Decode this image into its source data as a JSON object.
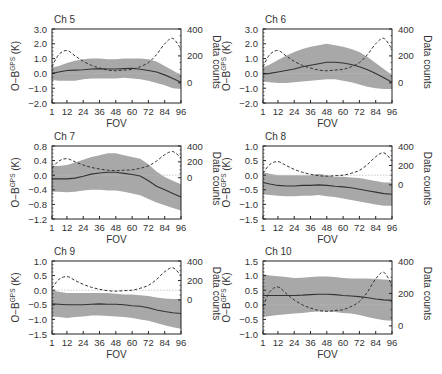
{
  "figure": {
    "xlabel": "FOV",
    "ylabel_left_prefix": "O−B",
    "ylabel_left_sup": "GPS",
    "ylabel_left_suffix": " (K)",
    "ylabel_right": "Data counts",
    "colors": {
      "band": "#a8a8a8",
      "mean": "#333333",
      "counts": "#333333",
      "zero": "#bbbbbb",
      "axis": "#222222"
    }
  },
  "chart_data": [
    {
      "type": "line",
      "title": "Ch 5",
      "x": [
        1,
        6,
        12,
        18,
        24,
        30,
        36,
        42,
        48,
        54,
        60,
        66,
        72,
        78,
        84,
        90,
        96
      ],
      "xticks": [
        1,
        12,
        24,
        36,
        48,
        60,
        72,
        84,
        96
      ],
      "ylim": [
        -2.0,
        3.0
      ],
      "yticks": [
        -2.0,
        -1.0,
        0.0,
        1.0,
        2.0,
        3.0
      ],
      "ytick_labels": [
        "−2.0",
        "−1.0",
        "0.0",
        "1.0",
        "2.0",
        "3.0"
      ],
      "y2lim": [
        -150,
        400
      ],
      "y2ticks": [
        0,
        200,
        400
      ],
      "series": [
        {
          "name": "mean O-B",
          "values": [
            0.0,
            0.1,
            0.2,
            0.22,
            0.25,
            0.3,
            0.32,
            0.3,
            0.3,
            0.32,
            0.35,
            0.28,
            0.2,
            0.1,
            -0.1,
            -0.35,
            -0.6
          ]
        },
        {
          "name": "std upper",
          "values": [
            0.4,
            0.5,
            0.7,
            0.85,
            0.95,
            1.0,
            1.0,
            0.95,
            0.95,
            1.0,
            1.0,
            1.0,
            0.95,
            0.8,
            0.5,
            0.2,
            -0.1
          ]
        },
        {
          "name": "std lower",
          "values": [
            -0.45,
            -0.5,
            -0.5,
            -0.5,
            -0.4,
            -0.35,
            -0.35,
            -0.35,
            -0.35,
            -0.3,
            -0.35,
            -0.4,
            -0.5,
            -0.65,
            -0.8,
            -1.0,
            -1.05
          ]
        },
        {
          "name": "data counts",
          "axis": "right",
          "values": [
            120,
            210,
            240,
            200,
            160,
            130,
            110,
            95,
            90,
            95,
            100,
            120,
            150,
            210,
            290,
            330,
            250
          ]
        }
      ]
    },
    {
      "type": "line",
      "title": "Ch 6",
      "x": [
        1,
        6,
        12,
        18,
        24,
        30,
        36,
        42,
        48,
        54,
        60,
        66,
        72,
        78,
        84,
        90,
        96
      ],
      "xticks": [
        1,
        12,
        24,
        36,
        48,
        60,
        72,
        84,
        96
      ],
      "ylim": [
        -2.0,
        3.0
      ],
      "yticks": [
        -2.0,
        -1.0,
        0.0,
        1.0,
        2.0,
        3.0
      ],
      "ytick_labels": [
        "−2.0",
        "−1.0",
        "0.0",
        "1.0",
        "2.0",
        "3.0"
      ],
      "y2lim": [
        -150,
        400
      ],
      "y2ticks": [
        0,
        200,
        400
      ],
      "series": [
        {
          "name": "mean O-B",
          "values": [
            -0.05,
            0.0,
            0.1,
            0.2,
            0.3,
            0.45,
            0.55,
            0.65,
            0.75,
            0.75,
            0.7,
            0.6,
            0.45,
            0.25,
            0.0,
            -0.3,
            -0.6
          ]
        },
        {
          "name": "std upper",
          "values": [
            0.4,
            0.6,
            0.9,
            1.2,
            1.45,
            1.65,
            1.8,
            1.9,
            2.0,
            1.9,
            1.8,
            1.65,
            1.45,
            1.1,
            0.7,
            0.3,
            -0.1
          ]
        },
        {
          "name": "std lower",
          "values": [
            -0.55,
            -0.6,
            -0.65,
            -0.65,
            -0.6,
            -0.55,
            -0.5,
            -0.45,
            -0.4,
            -0.4,
            -0.5,
            -0.6,
            -0.75,
            -0.9,
            -1.0,
            -1.05,
            -1.05
          ]
        },
        {
          "name": "data counts",
          "axis": "right",
          "values": [
            120,
            210,
            240,
            200,
            160,
            130,
            110,
            95,
            90,
            95,
            100,
            120,
            150,
            210,
            290,
            330,
            250
          ]
        }
      ]
    },
    {
      "type": "line",
      "title": "Ch 7",
      "x": [
        1,
        6,
        12,
        18,
        24,
        30,
        36,
        42,
        48,
        54,
        60,
        66,
        72,
        78,
        84,
        90,
        96
      ],
      "xticks": [
        1,
        12,
        24,
        36,
        48,
        60,
        72,
        84,
        96
      ],
      "ylim": [
        -1.2,
        0.8
      ],
      "yticks": [
        -1.2,
        -0.8,
        -0.4,
        0.0,
        0.4,
        0.8
      ],
      "ytick_labels": [
        "−1.2",
        "−0.8",
        "−0.4",
        "0.0",
        "0.4",
        "0.8"
      ],
      "y2lim": [
        -520,
        400
      ],
      "y2ticks": [
        0,
        200,
        400
      ],
      "series": [
        {
          "name": "mean O-B",
          "values": [
            -0.1,
            -0.1,
            -0.1,
            -0.08,
            -0.03,
            0.03,
            0.06,
            0.08,
            0.08,
            0.05,
            0.02,
            -0.02,
            -0.15,
            -0.3,
            -0.4,
            -0.5,
            -0.6
          ]
        },
        {
          "name": "std upper",
          "values": [
            0.25,
            0.25,
            0.28,
            0.35,
            0.42,
            0.5,
            0.55,
            0.6,
            0.6,
            0.55,
            0.5,
            0.45,
            0.3,
            0.1,
            -0.05,
            -0.15,
            -0.25
          ]
        },
        {
          "name": "std lower",
          "values": [
            -0.45,
            -0.45,
            -0.47,
            -0.45,
            -0.42,
            -0.4,
            -0.4,
            -0.42,
            -0.42,
            -0.45,
            -0.5,
            -0.55,
            -0.65,
            -0.75,
            -0.82,
            -0.9,
            -0.97
          ]
        },
        {
          "name": "data counts",
          "axis": "right",
          "values": [
            120,
            210,
            240,
            200,
            160,
            130,
            110,
            95,
            90,
            95,
            100,
            120,
            150,
            210,
            290,
            330,
            250
          ]
        }
      ]
    },
    {
      "type": "line",
      "title": "Ch 8",
      "x": [
        1,
        6,
        12,
        18,
        24,
        30,
        36,
        42,
        48,
        54,
        60,
        66,
        72,
        78,
        84,
        90,
        96
      ],
      "xticks": [
        1,
        12,
        24,
        36,
        48,
        60,
        72,
        84,
        96
      ],
      "ylim": [
        -1.5,
        1.0
      ],
      "yticks": [
        -1.5,
        -1.0,
        -0.5,
        0.0,
        0.5,
        1.0
      ],
      "ytick_labels": [
        "−1.5",
        "−1.0",
        "−0.5",
        "0.0",
        "0.5",
        "1.0"
      ],
      "y2lim": [
        -350,
        400
      ],
      "y2ticks": [
        0,
        200,
        400
      ],
      "series": [
        {
          "name": "mean O-B",
          "values": [
            -0.25,
            -0.3,
            -0.35,
            -0.37,
            -0.37,
            -0.35,
            -0.35,
            -0.33,
            -0.35,
            -0.38,
            -0.4,
            -0.43,
            -0.48,
            -0.53,
            -0.58,
            -0.63,
            -0.65
          ]
        },
        {
          "name": "std upper",
          "values": [
            0.1,
            0.05,
            0.0,
            0.0,
            0.0,
            0.0,
            0.0,
            0.05,
            0.0,
            -0.05,
            -0.05,
            -0.08,
            -0.1,
            -0.15,
            -0.2,
            -0.25,
            -0.25
          ]
        },
        {
          "name": "std lower",
          "values": [
            -0.65,
            -0.68,
            -0.7,
            -0.72,
            -0.72,
            -0.7,
            -0.7,
            -0.68,
            -0.72,
            -0.75,
            -0.8,
            -0.85,
            -0.9,
            -0.95,
            -1.0,
            -1.05,
            -1.05
          ]
        },
        {
          "name": "data counts",
          "axis": "right",
          "values": [
            120,
            210,
            240,
            200,
            160,
            130,
            110,
            95,
            90,
            95,
            100,
            120,
            150,
            210,
            290,
            330,
            250
          ]
        }
      ]
    },
    {
      "type": "line",
      "title": "Ch 9",
      "x": [
        1,
        6,
        12,
        18,
        24,
        30,
        36,
        42,
        48,
        54,
        60,
        66,
        72,
        78,
        84,
        90,
        96
      ],
      "xticks": [
        1,
        12,
        24,
        36,
        48,
        60,
        72,
        84,
        96
      ],
      "ylim": [
        -1.5,
        1.0
      ],
      "yticks": [
        -1.5,
        -1.0,
        -0.5,
        0.0,
        0.5,
        1.0
      ],
      "ytick_labels": [
        "−1.5",
        "−1.0",
        "−0.5",
        "0.0",
        "0.5",
        "1.0"
      ],
      "y2lim": [
        -350,
        400
      ],
      "y2ticks": [
        0,
        200,
        400
      ],
      "series": [
        {
          "name": "mean O-B",
          "values": [
            -0.47,
            -0.48,
            -0.5,
            -0.5,
            -0.5,
            -0.48,
            -0.47,
            -0.48,
            -0.48,
            -0.5,
            -0.53,
            -0.55,
            -0.6,
            -0.68,
            -0.73,
            -0.77,
            -0.8
          ]
        },
        {
          "name": "std upper",
          "values": [
            0.0,
            -0.05,
            -0.1,
            -0.1,
            -0.1,
            -0.1,
            -0.1,
            -0.1,
            -0.12,
            -0.15,
            -0.15,
            -0.17,
            -0.2,
            -0.25,
            -0.28,
            -0.3,
            -0.3
          ]
        },
        {
          "name": "std lower",
          "values": [
            -0.9,
            -0.92,
            -0.95,
            -0.92,
            -0.9,
            -0.87,
            -0.87,
            -0.88,
            -0.9,
            -0.92,
            -0.95,
            -1.0,
            -1.05,
            -1.12,
            -1.2,
            -1.27,
            -1.32
          ]
        },
        {
          "name": "data counts",
          "axis": "right",
          "values": [
            120,
            210,
            240,
            200,
            160,
            130,
            110,
            95,
            90,
            95,
            100,
            120,
            150,
            210,
            290,
            330,
            250
          ]
        }
      ]
    },
    {
      "type": "line",
      "title": "Ch 10",
      "x": [
        1,
        6,
        12,
        18,
        24,
        30,
        36,
        42,
        48,
        54,
        60,
        66,
        72,
        78,
        84,
        90,
        96
      ],
      "xticks": [
        1,
        12,
        24,
        36,
        48,
        60,
        72,
        84,
        96
      ],
      "ylim": [
        -1.0,
        1.5
      ],
      "yticks": [
        -1.0,
        -0.5,
        0.0,
        0.5,
        1.0,
        1.5
      ],
      "ytick_labels": [
        "−1.0",
        "−0.5",
        "0.0",
        "0.5",
        "1.0",
        "1.5"
      ],
      "y2lim": [
        -50,
        400
      ],
      "y2ticks": [
        0,
        200,
        400
      ],
      "series": [
        {
          "name": "mean O-B",
          "values": [
            0.32,
            0.32,
            0.32,
            0.32,
            0.32,
            0.33,
            0.35,
            0.36,
            0.36,
            0.35,
            0.32,
            0.3,
            0.28,
            0.24,
            0.2,
            0.17,
            0.15
          ]
        },
        {
          "name": "std upper",
          "values": [
            1.05,
            1.0,
            0.98,
            0.95,
            0.92,
            0.93,
            0.95,
            0.97,
            0.97,
            0.95,
            0.92,
            0.9,
            0.9,
            0.9,
            0.88,
            0.87,
            0.85
          ]
        },
        {
          "name": "std lower",
          "values": [
            -0.42,
            -0.38,
            -0.35,
            -0.32,
            -0.3,
            -0.28,
            -0.25,
            -0.23,
            -0.23,
            -0.25,
            -0.28,
            -0.3,
            -0.35,
            -0.42,
            -0.48,
            -0.53,
            -0.55
          ]
        },
        {
          "name": "data counts",
          "axis": "right",
          "values": [
            120,
            210,
            240,
            200,
            160,
            130,
            110,
            95,
            90,
            95,
            100,
            120,
            150,
            210,
            290,
            330,
            250
          ]
        }
      ]
    }
  ]
}
